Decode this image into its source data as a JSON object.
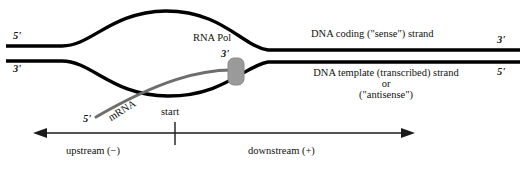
{
  "diagram": {
    "background_color": "#ffffff",
    "dna_color": "#000000",
    "mrna_color": "#6e6e6e",
    "polymerase_color": "#9a9a9a",
    "axis_color": "#1a1a1a",
    "left_end": {
      "top_prime": "5'",
      "bottom_prime": "3'"
    },
    "right_end": {
      "top_prime": "3'",
      "bottom_prime": "5'"
    },
    "coding_strand_label": "DNA coding (\"sense\") strand",
    "template_strand_label": {
      "line1": "DNA template (transcribed) strand",
      "line2": "or",
      "line3": "(\"antisense\")"
    },
    "polymerase": {
      "name": "RNA Pol",
      "prime": "3'"
    },
    "mrna": {
      "name": "mRNA",
      "prime": "5'"
    },
    "start_label": "start",
    "axis": {
      "upstream_label": "upstream (−)",
      "downstream_label": "downstream (+)"
    }
  }
}
